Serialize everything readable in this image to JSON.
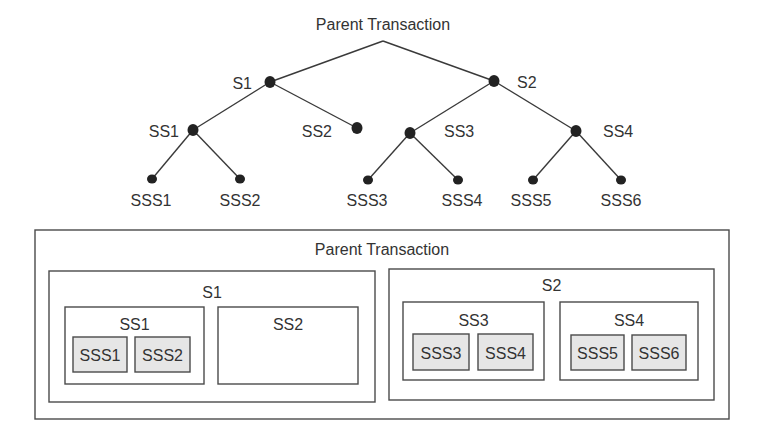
{
  "colors": {
    "line": "#3a3a3a",
    "node": "#222222",
    "text": "#333333",
    "box_border": "#4a4a4a",
    "leaf_fill": "#e6e6e6",
    "background": "#ffffff"
  },
  "tree": {
    "root": {
      "id": "root",
      "label": "Parent Transaction",
      "x": 383,
      "y": 41,
      "label_x": 383,
      "label_y": 24,
      "anchor": "middle"
    },
    "nodes": [
      {
        "id": "S1",
        "label": "S1",
        "x": 270,
        "y": 82,
        "label_x": 252,
        "label_y": 83,
        "anchor": "end"
      },
      {
        "id": "S2",
        "label": "S2",
        "x": 494,
        "y": 81,
        "label_x": 517,
        "label_y": 82,
        "anchor": "start"
      },
      {
        "id": "SS1",
        "label": "SS1",
        "x": 193,
        "y": 130,
        "label_x": 179,
        "label_y": 131,
        "anchor": "end"
      },
      {
        "id": "SS2",
        "label": "SS2",
        "x": 357,
        "y": 128,
        "label_x": 332,
        "label_y": 131,
        "anchor": "end"
      },
      {
        "id": "SS3",
        "label": "SS3",
        "x": 410,
        "y": 133,
        "label_x": 444,
        "label_y": 131,
        "anchor": "start"
      },
      {
        "id": "SS4",
        "label": "SS4",
        "x": 576,
        "y": 131,
        "label_x": 603,
        "label_y": 131,
        "anchor": "start"
      },
      {
        "id": "SSS1",
        "label": "SSS1",
        "x": 152,
        "y": 179,
        "label_x": 151,
        "label_y": 200,
        "anchor": "middle"
      },
      {
        "id": "SSS2",
        "label": "SSS2",
        "x": 240,
        "y": 179,
        "label_x": 240,
        "label_y": 200,
        "anchor": "middle"
      },
      {
        "id": "SSS3",
        "label": "SSS3",
        "x": 368,
        "y": 180,
        "label_x": 367,
        "label_y": 200,
        "anchor": "middle"
      },
      {
        "id": "SSS4",
        "label": "SSS4",
        "x": 458,
        "y": 180,
        "label_x": 462,
        "label_y": 200,
        "anchor": "middle"
      },
      {
        "id": "SSS5",
        "label": "SSS5",
        "x": 533,
        "y": 180,
        "label_x": 531,
        "label_y": 200,
        "anchor": "middle"
      },
      {
        "id": "SSS6",
        "label": "SSS6",
        "x": 621,
        "y": 180,
        "label_x": 621,
        "label_y": 200,
        "anchor": "middle"
      }
    ],
    "edges": [
      [
        "root",
        "S1"
      ],
      [
        "root",
        "S2"
      ],
      [
        "S1",
        "SS1"
      ],
      [
        "S1",
        "SS2"
      ],
      [
        "S2",
        "SS3"
      ],
      [
        "S2",
        "SS4"
      ],
      [
        "SS1",
        "SSS1"
      ],
      [
        "SS1",
        "SSS2"
      ],
      [
        "SS3",
        "SSS3"
      ],
      [
        "SS3",
        "SSS4"
      ],
      [
        "SS4",
        "SSS5"
      ],
      [
        "SS4",
        "SSS6"
      ]
    ]
  },
  "nested": {
    "boxes": [
      {
        "id": "parent",
        "label": "Parent Transaction",
        "x": 35,
        "y": 230,
        "w": 694,
        "h": 189,
        "label_y": 249,
        "leaf": false
      },
      {
        "id": "S1",
        "label": "S1",
        "x": 49,
        "y": 271,
        "w": 326,
        "h": 131,
        "label_y": 292,
        "leaf": false
      },
      {
        "id": "S2",
        "label": "S2",
        "x": 389,
        "y": 269,
        "w": 325,
        "h": 131,
        "label_y": 285,
        "leaf": false
      },
      {
        "id": "SS1",
        "label": "SS1",
        "x": 65,
        "y": 307,
        "w": 139,
        "h": 77,
        "label_y": 324,
        "leaf": false
      },
      {
        "id": "SS2",
        "label": "SS2",
        "x": 218,
        "y": 307,
        "w": 140,
        "h": 77,
        "label_y": 324,
        "leaf": false
      },
      {
        "id": "SS3",
        "label": "SS3",
        "x": 403,
        "y": 302,
        "w": 141,
        "h": 78,
        "label_y": 320,
        "leaf": false
      },
      {
        "id": "SS4",
        "label": "SS4",
        "x": 560,
        "y": 302,
        "w": 138,
        "h": 78,
        "label_y": 320,
        "leaf": false
      },
      {
        "id": "SSS1",
        "label": "SSS1",
        "x": 73,
        "y": 337,
        "w": 54,
        "h": 35,
        "label_y": 355,
        "leaf": true
      },
      {
        "id": "SSS2",
        "label": "SSS2",
        "x": 135,
        "y": 337,
        "w": 55,
        "h": 35,
        "label_y": 355,
        "leaf": true
      },
      {
        "id": "SSS3",
        "label": "SSS3",
        "x": 413,
        "y": 334,
        "w": 56,
        "h": 36,
        "label_y": 353,
        "leaf": true
      },
      {
        "id": "SSS4",
        "label": "SSS4",
        "x": 478,
        "y": 334,
        "w": 55,
        "h": 36,
        "label_y": 353,
        "leaf": true
      },
      {
        "id": "SSS5",
        "label": "SSS5",
        "x": 571,
        "y": 335,
        "w": 53,
        "h": 35,
        "label_y": 353,
        "leaf": true
      },
      {
        "id": "SSS6",
        "label": "SSS6",
        "x": 632,
        "y": 335,
        "w": 54,
        "h": 35,
        "label_y": 353,
        "leaf": true
      }
    ]
  }
}
